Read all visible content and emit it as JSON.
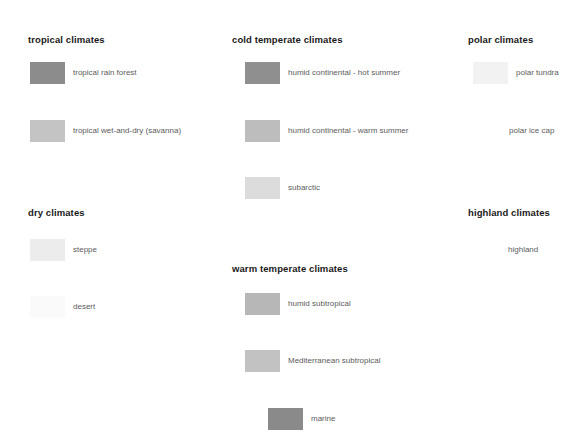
{
  "legend": {
    "title": "climate classification legend",
    "groups": [
      {
        "id": "tropical",
        "heading": "tropical climates",
        "entries": [
          {
            "label": "tropical rain forest",
            "color": "#8c8c8c"
          },
          {
            "label": "tropical wet-and-dry (savanna)",
            "color": "#c4c4c4"
          }
        ]
      },
      {
        "id": "dry",
        "heading": "dry climates",
        "entries": [
          {
            "label": "steppe",
            "color": "#ececec"
          },
          {
            "label": "desert",
            "color": "#fafafa"
          }
        ]
      },
      {
        "id": "cold-temperate",
        "heading": "cold temperate climates",
        "entries": [
          {
            "label": "humid continental - hot summer",
            "color": "#8f8f8f"
          },
          {
            "label": "humid continental - warm summer",
            "color": "#bdbdbd"
          },
          {
            "label": "subarctic",
            "color": "#dcdcdc"
          }
        ]
      },
      {
        "id": "warm-temperate",
        "heading": "warm temperate climates",
        "entries": [
          {
            "label": "humid subtropical",
            "color": "#b7b7b7"
          },
          {
            "label": "Mediterranean subtropical",
            "color": "#c2c2c2"
          },
          {
            "label": "marine",
            "color": "#8a8a8a"
          }
        ]
      },
      {
        "id": "polar",
        "heading": "polar climates",
        "entries": [
          {
            "label": "polar tundra",
            "color": "#f2f2f2"
          },
          {
            "label": "polar ice cap",
            "color": "#ffffff"
          }
        ]
      },
      {
        "id": "highland",
        "heading": "highland climates",
        "entries": [
          {
            "label": "highland",
            "color": "#ffffff"
          }
        ]
      }
    ]
  }
}
